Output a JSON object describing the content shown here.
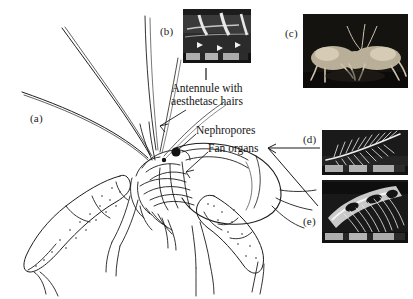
{
  "figure": {
    "background_color": "#ffffff",
    "ink_color": "#141414"
  },
  "panel_labels": {
    "a": "(a)",
    "b": "(b)",
    "c": "(c)",
    "d": "(d)",
    "e": "(e)"
  },
  "annotations": {
    "antennule_line1": "Antennule with",
    "antennule_line2": "aesthetasc hairs",
    "nephropores": "Nephropores",
    "fan_organs": "Fan organs"
  },
  "panels": {
    "a": {
      "name": "crayfish-line-drawing",
      "description": "Line drawing of a crayfish in anterior-lateral view with long antennae, stippled chelipeds and detailed head region"
    },
    "b": {
      "name": "antennule-micrograph",
      "description": "Scanning electron micrograph of antennule surface with aesthetasc hairs and arrow markers"
    },
    "c": {
      "name": "crayfish-pair-photograph",
      "description": "Photograph of two crayfish interacting on a dark background"
    },
    "d": {
      "name": "plumose-seta-micrograph",
      "description": "Scanning electron micrograph of a feather-like plumose seta of a fan organ"
    },
    "e": {
      "name": "seta-brush-micrograph",
      "description": "Scanning electron micrograph of a dense brush of setae on the fan organ"
    }
  }
}
